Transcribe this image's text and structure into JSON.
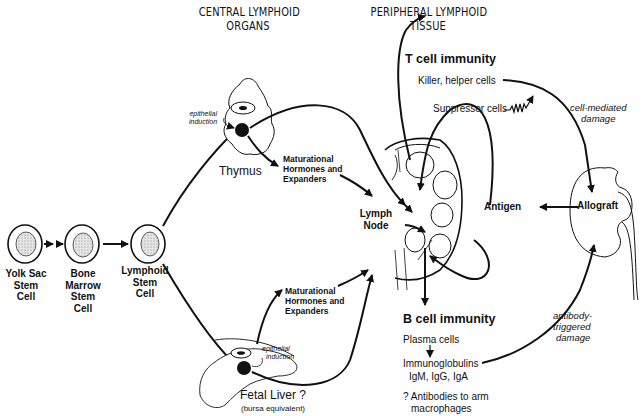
{
  "headers": {
    "central": [
      "CENTRAL LYMPHOID",
      "ORGANS"
    ],
    "peripheral": [
      "PERIPHERAL LYMPHOID",
      "TISSUE"
    ]
  },
  "stem_cells": [
    {
      "label": [
        "Yolk Sac",
        "Stem",
        "Cell"
      ]
    },
    {
      "label": [
        "Bone",
        "Marrow",
        "Stem",
        "Cell"
      ]
    },
    {
      "label": [
        "Lymphoid",
        "Stem",
        "Cell"
      ]
    }
  ],
  "thymus": {
    "label": "Thymus",
    "epithelial_induction": [
      "epithelial",
      "induction"
    ],
    "maturational": [
      "Maturational",
      "Hormones and",
      "Expanders"
    ]
  },
  "fetal_liver": {
    "label": "Fetal Liver ?",
    "sublabel": "(bursa equivalent)",
    "epithelial_induction": [
      "epithelial",
      "induction"
    ],
    "maturational": [
      "Maturational",
      "Hormones and",
      "Expanders"
    ]
  },
  "lymph_node": {
    "label": [
      "Lymph",
      "Node"
    ]
  },
  "antigen": {
    "label": "Antigen"
  },
  "allograft": {
    "label": "Allograft"
  },
  "t_cell": {
    "title": "T cell immunity",
    "killer": "Killer, helper cells",
    "suppressor": "Suppressor cells",
    "damage": [
      "cell-mediated",
      "damage"
    ]
  },
  "b_cell": {
    "title": "B cell immunity",
    "plasma": "Plasma cells",
    "immunoglobulins": "Immunoglobulins",
    "classes": "IgM, IgG, IgA",
    "antibodies": [
      "? Antibodies to arm",
      "macrophages"
    ],
    "damage": [
      "antibody-",
      "triggered",
      "damage"
    ]
  },
  "colors": {
    "ink": "#111111",
    "stipple": "#c8c8c8",
    "background": "#ffffff"
  }
}
